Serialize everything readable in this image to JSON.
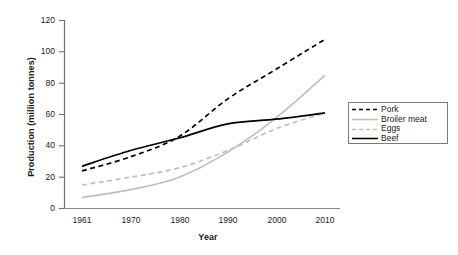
{
  "chart_data": {
    "type": "line",
    "title": "",
    "xlabel": "Year",
    "ylabel": "Production (million tonnes)",
    "xlim": [
      1961,
      2010
    ],
    "ylim": [
      0,
      120
    ],
    "yticks": [
      0,
      20,
      40,
      60,
      80,
      100,
      120
    ],
    "xticks": [
      1961,
      1970,
      1980,
      1990,
      2000,
      2010
    ],
    "grid": false,
    "legend_position": "right",
    "x": [
      1961,
      1970,
      1980,
      1990,
      2000,
      2010
    ],
    "series": [
      {
        "name": "Pork",
        "style": "dashed",
        "color": "#000000",
        "values": [
          24,
          33,
          46,
          70,
          89,
          108
        ]
      },
      {
        "name": "Broiler meat",
        "style": "solid",
        "color": "#bfbfbf",
        "values": [
          7,
          12,
          20,
          36,
          58,
          85
        ]
      },
      {
        "name": "Eggs",
        "style": "dashed",
        "color": "#bfbfbf",
        "values": [
          15,
          20,
          26,
          37,
          51,
          61
        ]
      },
      {
        "name": "Beef",
        "style": "solid",
        "color": "#000000",
        "values": [
          27,
          37,
          45,
          54,
          57,
          61
        ]
      }
    ]
  },
  "axes": {
    "ylabel": "Production (million tonnes)",
    "xlabel": "Year",
    "yticks": [
      "120",
      "100",
      "80",
      "60",
      "40",
      "20",
      "0"
    ],
    "xticks": [
      "1961",
      "1970",
      "1980",
      "1990",
      "2000",
      "2010"
    ]
  },
  "legend": {
    "items": [
      {
        "label": "Pork"
      },
      {
        "label": "Broiler meat"
      },
      {
        "label": "Eggs"
      },
      {
        "label": "Beef"
      }
    ]
  }
}
